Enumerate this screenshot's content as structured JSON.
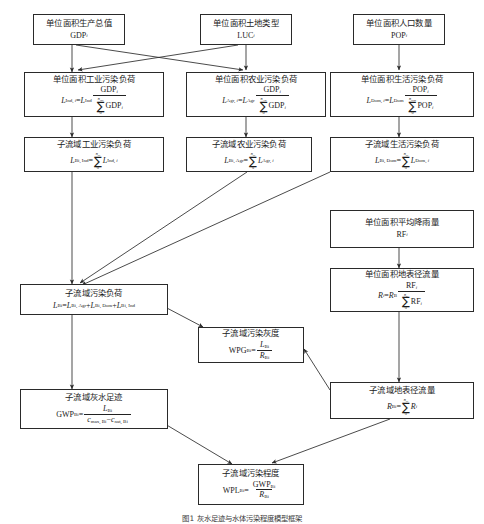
{
  "diagram": {
    "title_caption": "图1  灰水足迹与水体污染程度模型框架",
    "nodes": [
      {
        "id": "gdp",
        "name": "unit-area-gdp",
        "label": "单位面积生产总值",
        "symbol": "GDP",
        "symbol_sub": "i"
      },
      {
        "id": "luc",
        "name": "unit-area-land-use",
        "label": "单位面积土地类型",
        "symbol": "LUC",
        "symbol_sub": "i"
      },
      {
        "id": "pop",
        "name": "unit-area-population",
        "label": "单位面积人口数量",
        "symbol": "POP",
        "symbol_sub": "i"
      },
      {
        "id": "lind",
        "name": "unit-area-industrial-load",
        "label": "单位面积工业污染负荷",
        "formula": "L(Ind, i) = L(Ind) · GDP_i / Σ0..n_Ind GDP_i"
      },
      {
        "id": "lagr",
        "name": "unit-area-agricultural-load",
        "label": "单位面积农业污染负荷",
        "formula": "L(Agr, i) = L(Agr) · GDP_i / Σ0..n_Agr GDP_i"
      },
      {
        "id": "ldom",
        "name": "unit-area-domestic-load",
        "label": "单位面积生活污染负荷",
        "formula": "L(Dom, i) = L(Dom) · POP_i / Σ0..n_Dom POP_i"
      },
      {
        "id": "lbiind",
        "name": "subbasin-industrial-load",
        "label": "子流域工业污染负荷",
        "formula": "L(Bi, Ind) = Σ0..n_Bi L(Ind, i)"
      },
      {
        "id": "lbiagr",
        "name": "subbasin-agricultural-load",
        "label": "子流域农业污染负荷",
        "formula": "L(Bi, Agr) = Σ0..n_Bi L(Agr, i)"
      },
      {
        "id": "lbidom",
        "name": "subbasin-domestic-load",
        "label": "子流域生活污染负荷",
        "formula": "L(Bi, Dom) = Σ0..n_Bi L(Dom, i)"
      },
      {
        "id": "rf",
        "name": "unit-area-average-rainfall",
        "label": "单位面积平均降雨量",
        "symbol": "RF",
        "symbol_sub": "i"
      },
      {
        "id": "ri",
        "name": "unit-area-surface-runoff",
        "label": "单位面积地表径流量",
        "formula": "R_i = R_B · RF_i / Σ0..n_R RF_i"
      },
      {
        "id": "lbi",
        "name": "subbasin-pollution-load",
        "label": "子流域污染负荷",
        "formula": "L(Bi) = L(Bi, Agr) + L(Bi, Dom) + L(Bi, Ind)"
      },
      {
        "id": "wpg",
        "name": "subbasin-pollution-greyness",
        "label": "子流域污染灰度",
        "formula": "WPG(Bi) = L(Bi) / R(Bi)"
      },
      {
        "id": "rbi",
        "name": "subbasin-surface-runoff",
        "label": "子流域地表径流量",
        "formula": "R(Bi) = Σ0..n_Bi R_i"
      },
      {
        "id": "gwp",
        "name": "subbasin-grey-water-footprint",
        "label": "子流域灰水足迹",
        "formula": "GWP(Bi) = L(Bi) / (c_max,Bi − c_nat,Bi)"
      },
      {
        "id": "wpl",
        "name": "subbasin-pollution-degree",
        "label": "子流域污染程度",
        "formula": "WPL(Bi) = GWP(Bi) / R(Bi)"
      }
    ],
    "symbols": {
      "L": "L",
      "GDP": "GDP",
      "POP": "POP",
      "RF": "RF",
      "R": "R",
      "c": "c",
      "GWP": "GWP",
      "WPG": "WPG",
      "WPL": "WPL",
      "sigma": "∑",
      "zero": "0",
      "n": "n",
      "i": "i",
      "B": "B",
      "Bi": "Bi",
      "Ind": "Ind",
      "Agr": "Agr",
      "Dom": "Dom",
      "max": "max",
      "nat": "nat",
      "minus": "−",
      "plus": "+",
      "equals": "="
    },
    "colors": {
      "border": "#2a2a2a",
      "text": "#1a1a1a",
      "background": "#ffffff",
      "edge": "#333333"
    }
  }
}
